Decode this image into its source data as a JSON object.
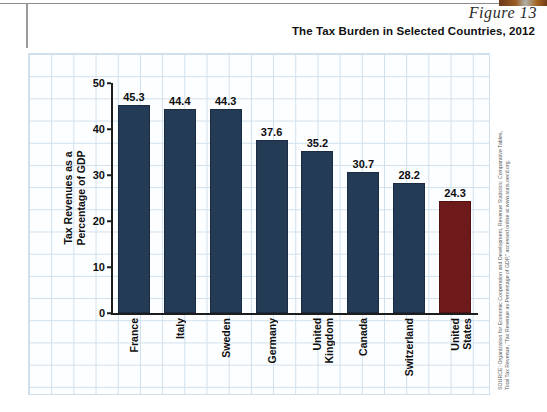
{
  "figure": {
    "label": "Figure 13",
    "title": "The Tax Burden in Selected Countries, 2012"
  },
  "source": {
    "line1": "SOURCE: Organization for Economic Cooperation and Development, Revenue Statistics: Comparative Tables,",
    "line2": "Total Tax Revenue, “Tax Revenue as Percentage of GDP,” accessed online at www.stats.oecd.org."
  },
  "colors": {
    "bar_navy": "#243b56",
    "bar_red": "#6e1a1a",
    "grid_line": "#cfe0ec",
    "axis": "#1d1d1d"
  },
  "chart_data": {
    "type": "bar",
    "title": "The Tax Burden in Selected Countries, 2012",
    "xlabel": "",
    "ylabel": "Tax Revenues as a Percentage of GDP",
    "ylabel_line1": "Tax Revenues as a",
    "ylabel_line2": "Percentage of GDP",
    "ylim": [
      0,
      50
    ],
    "yticks": [
      0,
      10,
      20,
      30,
      40,
      50
    ],
    "grid": true,
    "legend": "none",
    "categories": [
      "France",
      "Italy",
      "Sweden",
      "Germany",
      "United Kingdom",
      "Canada",
      "Switzerland",
      "United States"
    ],
    "category_lines": [
      [
        "France"
      ],
      [
        "Italy"
      ],
      [
        "Sweden"
      ],
      [
        "Germany"
      ],
      [
        "United",
        "Kingdom"
      ],
      [
        "Canada"
      ],
      [
        "Switzerland"
      ],
      [
        "United",
        "States"
      ]
    ],
    "values": [
      45.3,
      44.4,
      44.3,
      37.6,
      35.2,
      30.7,
      28.2,
      24.3
    ],
    "value_labels": [
      "45.3",
      "44.4",
      "44.3",
      "37.6",
      "35.2",
      "30.7",
      "28.2",
      "24.3"
    ],
    "bar_colors": [
      "#243b56",
      "#243b56",
      "#243b56",
      "#243b56",
      "#243b56",
      "#243b56",
      "#243b56",
      "#6e1a1a"
    ],
    "highlighted_category": "United States"
  }
}
